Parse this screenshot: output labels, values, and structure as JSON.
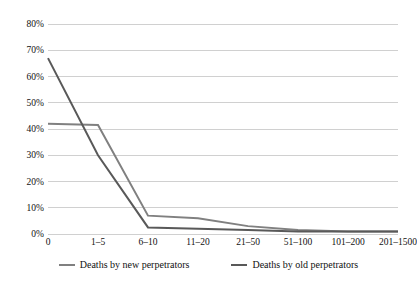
{
  "chart_data": {
    "type": "line",
    "title": "",
    "subtitle": "",
    "xlabel": "",
    "ylabel": "",
    "categories": [
      "0",
      "1–5",
      "6–10",
      "11–20",
      "21–50",
      "51–100",
      "101–200",
      "201–1500"
    ],
    "ylim": [
      0,
      80
    ],
    "ytick_labels": [
      "0%",
      "10%",
      "20%",
      "30%",
      "40%",
      "50%",
      "60%",
      "70%",
      "80%"
    ],
    "ytick_values": [
      0,
      10,
      20,
      30,
      40,
      50,
      60,
      70,
      80
    ],
    "grid": "horizontal",
    "legend_position": "bottom",
    "series": [
      {
        "name": "Deaths by new perpetrators",
        "color": "#808080",
        "values": [
          42,
          41.5,
          7,
          6,
          3,
          1.5,
          1,
          1
        ]
      },
      {
        "name": "Deaths by old perpetrators",
        "color": "#595959",
        "values": [
          67,
          30,
          2.5,
          2,
          1.5,
          1,
          1,
          1
        ]
      }
    ]
  },
  "legend": {
    "items": [
      {
        "label": "Deaths by new perpetrators",
        "color": "#808080"
      },
      {
        "label": "Deaths by old perpetrators",
        "color": "#595959"
      }
    ]
  },
  "colors": {
    "background": "#ffffff",
    "gridline": "#d0d0d0",
    "text": "#111111",
    "series_new": "#808080",
    "series_old": "#595959"
  }
}
